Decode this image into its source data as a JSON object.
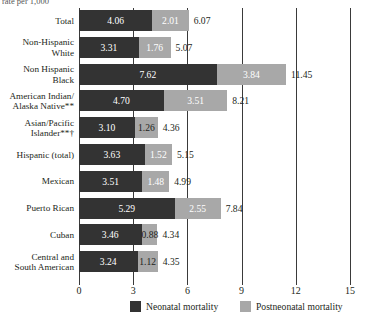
{
  "figure": {
    "top_cut_text": "rate per 1,000",
    "axis": {
      "ticks": [
        "0",
        "3",
        "6",
        "9",
        "12",
        "15"
      ],
      "tick_values": [
        0,
        3,
        6,
        9,
        12,
        15
      ],
      "min": 0,
      "max": 15
    },
    "legend": [
      {
        "key": "neonatal",
        "label": "Neonatal mortality",
        "color": "#333333"
      },
      {
        "key": "postneonatal",
        "label": "Postneonatal mortality",
        "color": "#a8a8a8"
      }
    ]
  },
  "chart_data": {
    "type": "bar",
    "orientation": "horizontal",
    "stacked": true,
    "title": "",
    "subtitle": "",
    "xlabel": "",
    "ylabel": "",
    "xlim": [
      0,
      15
    ],
    "grid": true,
    "legend_position": "bottom",
    "categories": [
      "Total",
      "Non-Hispanic\nWhite",
      "Non Hispanic\nBlack",
      "American Indian/\nAlaska Native**",
      "Asian/Pacific\nIslander**†",
      "Hispanic (total)",
      "Mexican",
      "Puerto Rican",
      "Cuban",
      "Central and\nSouth American"
    ],
    "series": [
      {
        "name": "Neonatal mortality",
        "color": "#333333",
        "values": [
          4.06,
          3.31,
          7.62,
          4.7,
          3.1,
          3.63,
          3.51,
          5.29,
          3.46,
          3.24
        ]
      },
      {
        "name": "Postneonatal mortality",
        "color": "#a8a8a8",
        "values": [
          2.01,
          1.76,
          3.84,
          3.51,
          1.26,
          1.52,
          1.48,
          2.55,
          0.88,
          1.12
        ]
      }
    ],
    "totals": [
      6.07,
      5.07,
      11.45,
      8.21,
      4.36,
      5.15,
      4.99,
      7.84,
      4.34,
      4.35
    ],
    "value_labels": {
      "neonatal": [
        "4.06",
        "3.31",
        "7.62",
        "4.70",
        "3.10",
        "3.63",
        "3.51",
        "5.29",
        "3.46",
        "3.24"
      ],
      "postneonatal": [
        "2.01",
        "1.76",
        "3.84",
        "3.51",
        "1.26",
        "1.52",
        "1.48",
        "2.55",
        "0.88",
        "1.12"
      ],
      "total": [
        "6.07",
        "5.07",
        "11.45",
        "8.21",
        "4.36",
        "5.15",
        "4.99",
        "7.84",
        "4.34",
        "4.35"
      ]
    }
  }
}
